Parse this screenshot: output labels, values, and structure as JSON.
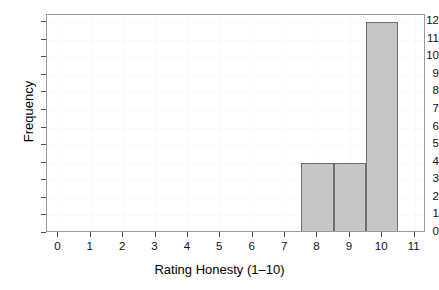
{
  "chart_data": {
    "type": "bar",
    "title": "",
    "xlabel": "Rating Honesty (1–10)",
    "ylabel": "Frequency",
    "xlim": [
      -0.35,
      11.35
    ],
    "ylim": [
      0,
      12.4
    ],
    "grid": true,
    "legend": null,
    "bin_width": 1,
    "bin_edges": [
      0.5,
      1.5,
      2.5,
      3.5,
      4.5,
      5.5,
      6.5,
      7.5,
      8.5,
      9.5,
      10.5
    ],
    "categories": [
      "0.5–1.5",
      "1.5–2.5",
      "2.5–3.5",
      "3.5–4.5",
      "4.5–5.5",
      "5.5–6.5",
      "6.5–7.5",
      "7.5–8.5",
      "8.5–9.5",
      "9.5–10.5"
    ],
    "values": [
      0,
      0,
      0,
      0,
      0,
      0,
      0,
      4,
      4,
      12
    ],
    "xticks": [
      0,
      1,
      2,
      3,
      4,
      5,
      6,
      7,
      8,
      9,
      10,
      11
    ],
    "yticks": [
      0,
      1,
      2,
      3,
      4,
      5,
      6,
      7,
      8,
      9,
      10,
      11,
      12
    ],
    "xtick_labels": [
      "0",
      "1",
      "2",
      "3",
      "4",
      "5",
      "6",
      "7",
      "8",
      "9",
      "10",
      "11"
    ],
    "ytick_labels": [
      "0",
      "1",
      "2",
      "3",
      "4",
      "5",
      "6",
      "7",
      "8",
      "9",
      "10",
      "11",
      "12"
    ],
    "bar_fill_color": "#c6c6c6",
    "bar_border_color": "#6e6e6e",
    "panel_border_color": "#9a9a9a",
    "grid_color": "#fafafa",
    "background_color": "#ffffff"
  },
  "cropped_title": " "
}
